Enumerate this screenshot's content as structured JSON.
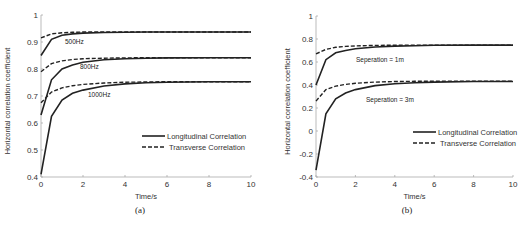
{
  "chart_data": [
    {
      "type": "line",
      "panel": "(a)",
      "xlabel": "Time/s",
      "ylabel": "Horizontal correlation coefficient",
      "xlim": [
        0,
        10
      ],
      "ylim": [
        0.4,
        1
      ],
      "xticks": [
        "0",
        "2",
        "4",
        "6",
        "8",
        "10"
      ],
      "yticks": [
        "0.4",
        "0.5",
        "0.6",
        "0.7",
        "0.8",
        "0.9",
        "1"
      ],
      "grid": false,
      "legend": [
        "Longitudinal Correlation",
        "Transverse Correlation"
      ],
      "legend_position": "lower right",
      "annotations": [
        "500Hz",
        "800Hz",
        "1000Hz"
      ],
      "x": [
        0,
        0.5,
        1,
        1.5,
        2,
        3,
        4,
        5,
        6,
        8,
        10
      ],
      "series": [
        {
          "name": "Longitudinal 500Hz",
          "style": "solid",
          "values": [
            0.85,
            0.91,
            0.925,
            0.93,
            0.933,
            0.935,
            0.936,
            0.937,
            0.937,
            0.937,
            0.937
          ]
        },
        {
          "name": "Transverse 500Hz",
          "style": "dashed",
          "values": [
            0.915,
            0.93,
            0.934,
            0.936,
            0.937,
            0.937,
            0.937,
            0.937,
            0.937,
            0.937,
            0.937
          ]
        },
        {
          "name": "Longitudinal 800Hz",
          "style": "solid",
          "values": [
            0.63,
            0.76,
            0.8,
            0.815,
            0.825,
            0.834,
            0.838,
            0.84,
            0.841,
            0.842,
            0.842
          ]
        },
        {
          "name": "Transverse 800Hz",
          "style": "dashed",
          "values": [
            0.79,
            0.82,
            0.83,
            0.835,
            0.838,
            0.84,
            0.841,
            0.842,
            0.842,
            0.842,
            0.842
          ]
        },
        {
          "name": "Longitudinal 1000Hz",
          "style": "solid",
          "values": [
            0.41,
            0.625,
            0.685,
            0.71,
            0.722,
            0.737,
            0.745,
            0.749,
            0.751,
            0.753,
            0.753
          ]
        },
        {
          "name": "Transverse 1000Hz",
          "style": "dashed",
          "values": [
            0.675,
            0.715,
            0.73,
            0.738,
            0.743,
            0.748,
            0.751,
            0.752,
            0.753,
            0.753,
            0.753
          ]
        }
      ]
    },
    {
      "type": "line",
      "panel": "(b)",
      "xlabel": "Time/s",
      "ylabel": "Horizontal correlation coefficient",
      "xlim": [
        0,
        10
      ],
      "ylim": [
        -0.4,
        1
      ],
      "xticks": [
        "0",
        "2",
        "4",
        "6",
        "8",
        "10"
      ],
      "yticks": [
        "-0.4",
        "-0.2",
        "0",
        "0.2",
        "0.4",
        "0.6",
        "0.8",
        "1"
      ],
      "grid": false,
      "legend": [
        "Longitudinal Correlation",
        "Transverse Correlation"
      ],
      "legend_position": "lower right",
      "annotations": [
        "Seperation = 1m",
        "Seperation = 3m"
      ],
      "x": [
        0,
        0.5,
        1,
        1.5,
        2,
        3,
        4,
        5,
        6,
        8,
        10
      ],
      "series": [
        {
          "name": "Longitudinal 1m",
          "style": "solid",
          "values": [
            0.4,
            0.62,
            0.68,
            0.7,
            0.715,
            0.73,
            0.738,
            0.742,
            0.745,
            0.747,
            0.747
          ]
        },
        {
          "name": "Transverse 1m",
          "style": "dashed",
          "values": [
            0.67,
            0.71,
            0.728,
            0.736,
            0.74,
            0.744,
            0.746,
            0.747,
            0.747,
            0.747,
            0.747
          ]
        },
        {
          "name": "Longitudinal 3m",
          "style": "solid",
          "values": [
            -0.34,
            0.15,
            0.28,
            0.33,
            0.36,
            0.395,
            0.41,
            0.42,
            0.425,
            0.43,
            0.43
          ]
        },
        {
          "name": "Transverse 3m",
          "style": "dashed",
          "values": [
            0.26,
            0.36,
            0.39,
            0.405,
            0.415,
            0.425,
            0.43,
            0.432,
            0.433,
            0.434,
            0.434
          ]
        }
      ]
    }
  ],
  "captions": [
    "(a)",
    "(b)"
  ]
}
